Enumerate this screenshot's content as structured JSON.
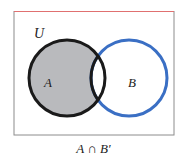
{
  "diagram": {
    "type": "venn-diagram",
    "universe_label": "U",
    "sets": [
      {
        "label": "A",
        "outline_color": "#1a1a1a",
        "shaded": true
      },
      {
        "label": "B",
        "outline_color": "#3a6fc4",
        "shaded": false
      }
    ],
    "shaded_region": "A only (A minus overlap with B)",
    "shade_color": "#b9babd",
    "caption": "A ∩ B′",
    "frame": {
      "top_border_color": "#e06a6a",
      "border_color": "#8c8c8c"
    }
  }
}
